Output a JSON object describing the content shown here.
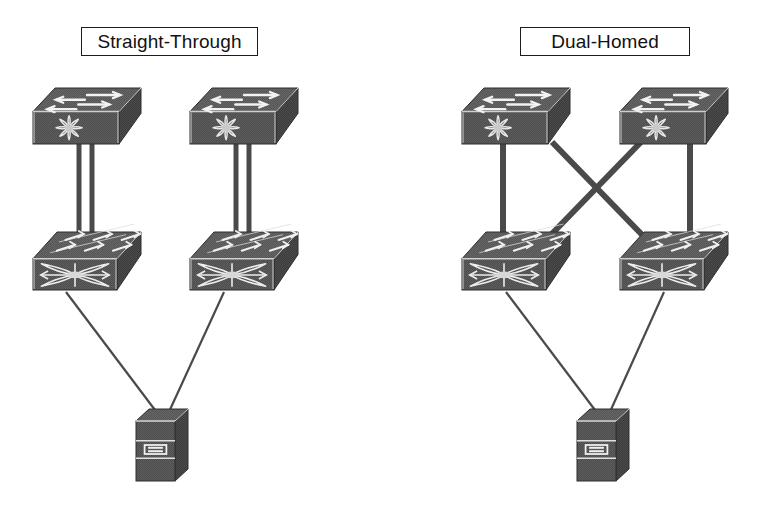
{
  "diagram": {
    "background_color": "#ffffff",
    "device_color": "#4d4d4d",
    "device_dark_color": "#3a3a3a",
    "device_top_color": "#555555",
    "line_color": "#4a4a4a",
    "thin_line_color": "#4a4a4a",
    "label_border_color": "#1c1c1c",
    "label_text_color": "#121212"
  },
  "panels": [
    {
      "id": "straight-through",
      "label": "Straight-Through",
      "label_box": {
        "x": 81,
        "y": 27,
        "width": 177,
        "height": 29
      },
      "uplink_style": "double-parallel-vertical",
      "uplink_description": "Each access switch connects straight up to the aggregation switch directly above it with two parallel links",
      "devices": [
        {
          "id": "st-agg-left",
          "type": "multilayer-switch",
          "role": "aggregation",
          "x": 33,
          "y": 88,
          "width": 108,
          "height": 56
        },
        {
          "id": "st-agg-right",
          "type": "multilayer-switch",
          "role": "aggregation",
          "x": 190,
          "y": 88,
          "width": 108,
          "height": 56
        },
        {
          "id": "st-access-left",
          "type": "grid-switch",
          "role": "access",
          "x": 33,
          "y": 232,
          "width": 108,
          "height": 58
        },
        {
          "id": "st-access-right",
          "type": "grid-switch",
          "role": "access",
          "x": 190,
          "y": 232,
          "width": 108,
          "height": 58
        },
        {
          "id": "st-server",
          "type": "server",
          "role": "server",
          "x": 136,
          "y": 409,
          "width": 52,
          "height": 72
        }
      ],
      "links": [
        {
          "from": "st-agg-left",
          "to": "st-access-left",
          "kind": "double-trunk",
          "weight": "thick"
        },
        {
          "from": "st-agg-right",
          "to": "st-access-right",
          "kind": "double-trunk",
          "weight": "thick"
        },
        {
          "from": "st-access-left",
          "to": "st-server",
          "kind": "access-link",
          "weight": "thin"
        },
        {
          "from": "st-access-right",
          "to": "st-server",
          "kind": "access-link",
          "weight": "thin"
        }
      ]
    },
    {
      "id": "dual-homed",
      "label": "Dual-Homed",
      "label_box": {
        "x": 520,
        "y": 27,
        "width": 170,
        "height": 29
      },
      "uplink_style": "crossed-x-plus-vertical",
      "uplink_description": "Each access switch connects to both aggregation switches, forming an X crossing pattern",
      "devices": [
        {
          "id": "dh-agg-left",
          "type": "multilayer-switch",
          "role": "aggregation",
          "x": 462,
          "y": 88,
          "width": 108,
          "height": 56
        },
        {
          "id": "dh-agg-right",
          "type": "multilayer-switch",
          "role": "aggregation",
          "x": 620,
          "y": 88,
          "width": 108,
          "height": 56
        },
        {
          "id": "dh-access-left",
          "type": "grid-switch",
          "role": "access",
          "x": 462,
          "y": 232,
          "width": 108,
          "height": 58
        },
        {
          "id": "dh-access-right",
          "type": "grid-switch",
          "role": "access",
          "x": 620,
          "y": 232,
          "width": 108,
          "height": 58
        },
        {
          "id": "dh-server",
          "type": "server",
          "role": "server",
          "x": 577,
          "y": 409,
          "width": 52,
          "height": 72
        }
      ],
      "links": [
        {
          "from": "dh-agg-left",
          "to": "dh-access-left",
          "kind": "uplink-vertical",
          "weight": "thick"
        },
        {
          "from": "dh-agg-right",
          "to": "dh-access-right",
          "kind": "uplink-vertical",
          "weight": "thick"
        },
        {
          "from": "dh-agg-left",
          "to": "dh-access-right",
          "kind": "uplink-cross",
          "weight": "thick"
        },
        {
          "from": "dh-agg-right",
          "to": "dh-access-left",
          "kind": "uplink-cross",
          "weight": "thick"
        },
        {
          "from": "dh-access-left",
          "to": "dh-server",
          "kind": "access-link",
          "weight": "thin"
        },
        {
          "from": "dh-access-right",
          "to": "dh-server",
          "kind": "access-link",
          "weight": "thin"
        }
      ]
    }
  ],
  "icons": {
    "multilayer_switch": "multilayer-switch-icon",
    "grid_switch": "workgroup-switch-icon",
    "server": "server-icon"
  }
}
